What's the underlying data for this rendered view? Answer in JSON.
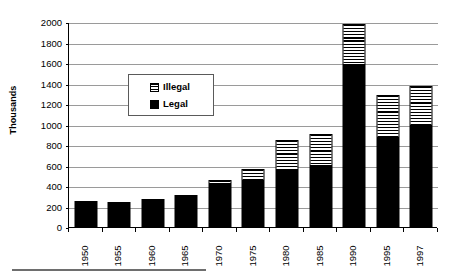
{
  "chart_data": {
    "type": "bar",
    "subtype": "stacked-vertical",
    "title": "",
    "xlabel": "",
    "ylabel": "Thousands",
    "ylim": [
      0,
      2000
    ],
    "ytick_step": 200,
    "yticks": [
      0,
      200,
      400,
      600,
      800,
      1000,
      1200,
      1400,
      1600,
      1800,
      2000
    ],
    "ytick_labels": [
      "0",
      "200",
      "400",
      "600",
      "800",
      "1000",
      "1200",
      "1400",
      "1600",
      "1800",
      "2000"
    ],
    "grid": "horizontal",
    "legend_position": "inside-upper-left",
    "categories": [
      "1950",
      "1955",
      "1960",
      "1965",
      "1970",
      "1975",
      "1980",
      "1985",
      "1990",
      "1995",
      "1997"
    ],
    "series": [
      {
        "name": "Legal",
        "swatch": "legal-solid-black",
        "color": "#000000",
        "values": [
          250,
          245,
          275,
          315,
          420,
          450,
          560,
          600,
          1580,
          870,
          990
        ]
      },
      {
        "name": "Illegal",
        "swatch": "illegal-hatched",
        "color": "#ffffff",
        "values": [
          0,
          0,
          0,
          0,
          40,
          115,
          290,
          310,
          400,
          420,
          390
        ]
      }
    ],
    "totals": [
      250,
      245,
      275,
      315,
      460,
      565,
      850,
      910,
      1980,
      1290,
      1380
    ]
  },
  "legend": {
    "items": [
      {
        "label": "Illegal",
        "swatch": "hatched-square-icon"
      },
      {
        "label": "Legal",
        "swatch": "filled-square-icon"
      }
    ]
  },
  "axis": {
    "y_title": "Thousands"
  },
  "colors": {
    "axis": "#000000",
    "gridline": "#9a9a9a",
    "legal": "#000000",
    "illegal_outline": "#000000",
    "background": "#ffffff",
    "rule": "#6e6e6e"
  }
}
